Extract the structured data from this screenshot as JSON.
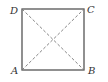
{
  "diagram": {
    "type": "square-with-diagonals",
    "colors": {
      "stroke": "#555555",
      "diagonal": "#777777",
      "label": "#333333"
    },
    "vertices": [
      {
        "name": "A",
        "x": 22,
        "y": 70
      },
      {
        "name": "B",
        "x": 84,
        "y": 70
      },
      {
        "name": "C",
        "x": 84,
        "y": 9
      },
      {
        "name": "D",
        "x": 22,
        "y": 9
      }
    ],
    "labels": {
      "A": "A",
      "B": "B",
      "C": "C",
      "D": "D"
    },
    "edges": [
      "AB",
      "BC",
      "CD",
      "DA"
    ],
    "diagonals": [
      "AC",
      "BD"
    ],
    "diagonal_style": "dashed"
  }
}
